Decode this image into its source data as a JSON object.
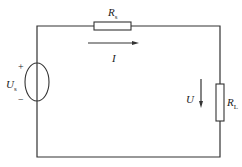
{
  "diagram": {
    "type": "circuit",
    "components": {
      "source": {
        "symbol": "U",
        "subscript": "s",
        "plus": "+",
        "minus": "−"
      },
      "series_resistor": {
        "symbol": "R",
        "subscript": "s"
      },
      "load_resistor": {
        "symbol": "R",
        "subscript": "L"
      }
    },
    "current": {
      "label": "I",
      "direction": "right"
    },
    "voltage": {
      "label": "U",
      "direction": "down"
    }
  }
}
